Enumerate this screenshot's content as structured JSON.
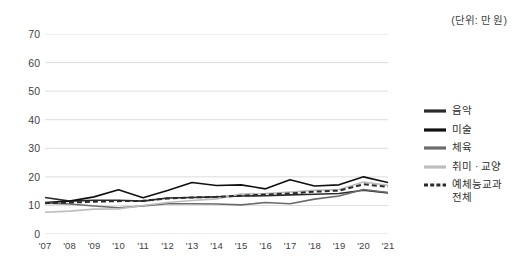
{
  "unit_caption": "(단위: 만 원)",
  "legend": {
    "items": [
      {
        "label": "음악",
        "color": "#2b2b2b",
        "style": "solid",
        "width": 3.2
      },
      {
        "label": "미술",
        "color": "#101010",
        "style": "solid",
        "width": 3.2
      },
      {
        "label": "체육",
        "color": "#6b6b6b",
        "style": "solid",
        "width": 3.2
      },
      {
        "label": "취미 · 교양",
        "color": "#bdbdbd",
        "style": "solid",
        "width": 3.2
      },
      {
        "label": "예체능교과\n전체",
        "color": "#2b2b2b",
        "style": "dashed",
        "width": 3.2
      }
    ]
  },
  "chart_data": {
    "type": "line",
    "title": "",
    "subtitle": "",
    "xlabel": "",
    "ylabel": "",
    "unit": "만 원",
    "ylim": [
      0,
      70
    ],
    "yticks": [
      0,
      10,
      20,
      30,
      40,
      50,
      60,
      70
    ],
    "ytick_labels": [
      "0",
      "10",
      "20",
      "30",
      "40",
      "50",
      "60",
      "70"
    ],
    "grid": true,
    "grid_axis": "y",
    "legend_position": "right",
    "categories": [
      "'07",
      "'08",
      "'09",
      "'10",
      "'11",
      "'12",
      "'13",
      "'14",
      "'15",
      "'16",
      "'17",
      "'18",
      "'19",
      "'20",
      "'21"
    ],
    "series": [
      {
        "name": "음악",
        "color": "#2b2b2b",
        "style": "solid",
        "values": [
          12.8,
          11.5,
          11.8,
          11.8,
          11.5,
          12.6,
          12.8,
          13.0,
          13.3,
          13.4,
          13.7,
          13.9,
          14.2,
          15.3,
          14.4
        ]
      },
      {
        "name": "미술",
        "color": "#101010",
        "style": "solid",
        "values": [
          11.0,
          11.5,
          13.0,
          15.5,
          12.7,
          15.2,
          18.0,
          17.0,
          17.2,
          15.8,
          19.0,
          16.8,
          17.2,
          20.0,
          18.0
        ]
      },
      {
        "name": "체육",
        "color": "#6b6b6b",
        "style": "solid",
        "values": [
          10.8,
          10.5,
          9.8,
          9.2,
          9.8,
          10.6,
          10.6,
          10.5,
          10.2,
          11.0,
          10.6,
          12.2,
          13.3,
          15.6,
          14.5
        ]
      },
      {
        "name": "취미 · 교양",
        "color": "#bdbdbd",
        "style": "solid",
        "values": [
          7.6,
          8.0,
          8.7,
          8.8,
          10.0,
          11.0,
          11.7,
          12.3,
          14.0,
          14.2,
          14.7,
          15.3,
          15.6,
          18.2,
          17.0
        ]
      },
      {
        "name": "예체능교과 전체",
        "color": "#2b2b2b",
        "style": "dashed",
        "values": [
          10.8,
          11.0,
          11.3,
          11.5,
          11.6,
          12.4,
          12.8,
          13.0,
          13.4,
          13.8,
          14.2,
          14.8,
          15.2,
          17.4,
          16.5
        ]
      }
    ]
  }
}
